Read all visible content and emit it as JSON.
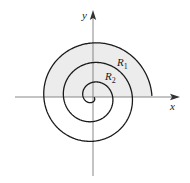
{
  "diagram": {
    "type": "polar-spiral-region",
    "axes": {
      "x_label": "x",
      "y_label": "y"
    },
    "regions": [
      {
        "label": "R",
        "subscript": "1"
      },
      {
        "label": "R",
        "subscript": "2"
      }
    ],
    "spiral": {
      "turns": 3,
      "direction": "outward-clockwise",
      "ends_on": "positive x-axis"
    },
    "colors": {
      "curve": "#1a1a1a",
      "axis": "#7a7a7a",
      "shading": "#ececec",
      "background": "#ffffff"
    }
  }
}
